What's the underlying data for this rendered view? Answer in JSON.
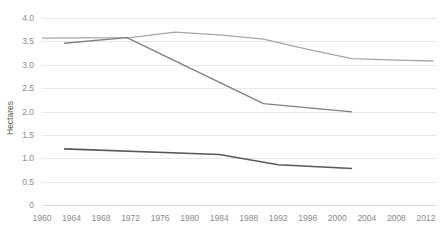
{
  "chart_data": {
    "type": "line",
    "title": "",
    "subtitle": "",
    "xlabel": "",
    "ylabel": "Hectares",
    "xlim": [
      1960,
      2013.5
    ],
    "ylim": [
      0,
      4.0
    ],
    "grid": true,
    "legend": "none",
    "x_ticks": [
      1960,
      1964,
      1968,
      1972,
      1976,
      1980,
      1984,
      1988,
      1992,
      1996,
      2000,
      2004,
      2008,
      2012
    ],
    "y_ticks": [
      0,
      0.5,
      1.0,
      1.5,
      2.0,
      2.5,
      3.0,
      3.5,
      4.0
    ],
    "y_tick_labels": [
      "0",
      "0.5",
      "1.0",
      "1.5",
      "2.0",
      "2.5",
      "3.0",
      "3.5",
      "4.0"
    ],
    "x_tick_labels": [
      "1960",
      "1964",
      "1968",
      "1972",
      "1976",
      "1980",
      "1984",
      "1988",
      "1992",
      "1996",
      "2000",
      "2004",
      "2008",
      "2012"
    ],
    "series": [
      {
        "name": "upper-series",
        "color": "#a6a6a6",
        "width": 1.3,
        "x": [
          1960,
          1972,
          1978,
          1984,
          1990,
          1996,
          2002,
          2008,
          2013
        ],
        "values": [
          3.57,
          3.58,
          3.7,
          3.64,
          3.55,
          3.33,
          3.13,
          3.1,
          3.08
        ]
      },
      {
        "name": "middle-series",
        "color": "#7f7f7f",
        "width": 1.3,
        "x": [
          1963,
          1971.5,
          1990,
          2002
        ],
        "values": [
          3.46,
          3.58,
          2.17,
          1.99
        ]
      },
      {
        "name": "lower-series",
        "color": "#595959",
        "width": 1.6,
        "x": [
          1963,
          1984,
          1992,
          2002
        ],
        "values": [
          1.2,
          1.08,
          0.86,
          0.78
        ]
      }
    ]
  },
  "axes": {
    "y_axis_title": "Hectares"
  }
}
